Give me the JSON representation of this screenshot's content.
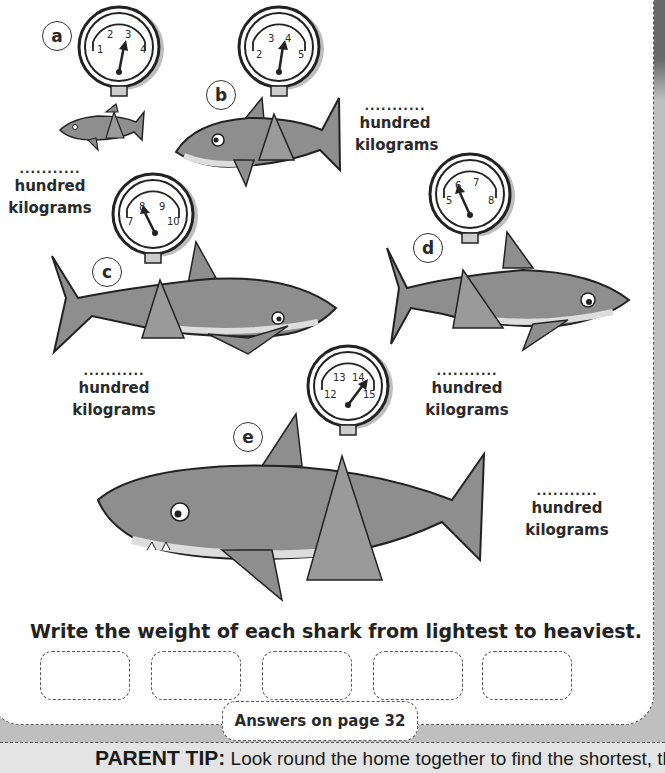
{
  "worksheet": {
    "instruction": "Write the weight of each shark from lightest to heaviest.",
    "answers_note": "Answers on page 32",
    "parent_tip_label": "PARENT TIP:",
    "parent_tip_text": " Look round the home together to find the shortest, the",
    "answer_boxes": [
      "",
      "",
      "",
      "",
      ""
    ]
  },
  "sharks": [
    {
      "id": "a",
      "gauge_labels": [
        "1",
        "2",
        "3",
        "4"
      ],
      "unit_blank": "...........",
      "unit_line1": "hundred",
      "unit_line2": "kilograms"
    },
    {
      "id": "b",
      "gauge_labels": [
        "2",
        "3",
        "4",
        "5"
      ],
      "unit_blank": "...........",
      "unit_line1": "hundred",
      "unit_line2": "kilograms"
    },
    {
      "id": "c",
      "gauge_labels": [
        "7",
        "8",
        "9",
        "10"
      ],
      "unit_blank": "...........",
      "unit_line1": "hundred",
      "unit_line2": "kilograms"
    },
    {
      "id": "d",
      "gauge_labels": [
        "5",
        "6",
        "7",
        "8"
      ],
      "unit_blank": "...........",
      "unit_line1": "hundred",
      "unit_line2": "kilograms"
    },
    {
      "id": "e",
      "gauge_labels": [
        "12",
        "13",
        "14",
        "15"
      ],
      "unit_blank": "...........",
      "unit_line1": "hundred",
      "unit_line2": "kilograms"
    }
  ],
  "colors": {
    "shark_body": "#8e8e8e",
    "shark_belly": "#d8d8d8",
    "sling": "#9a9a9a",
    "outline": "#222222",
    "panel_bg": "#ffffff",
    "page_bg": "#bfbfbf"
  }
}
